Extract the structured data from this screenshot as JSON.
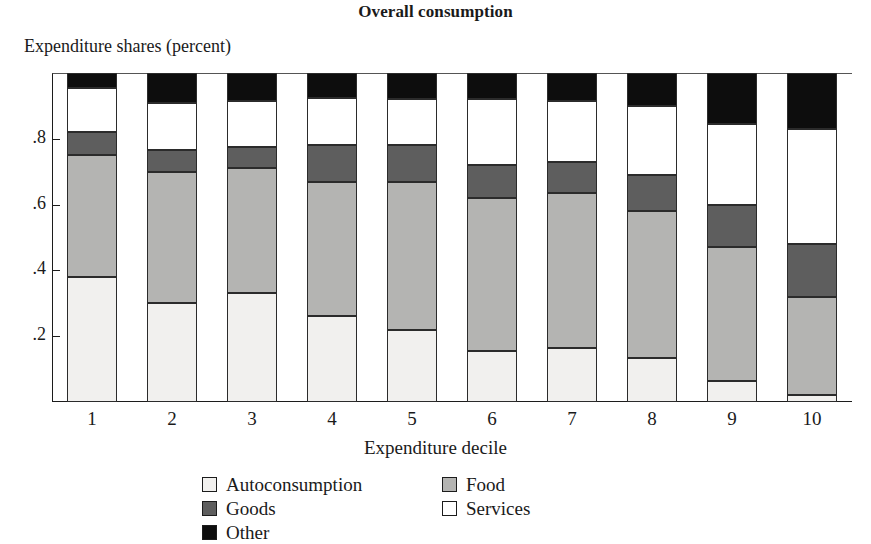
{
  "chart_data": {
    "type": "bar",
    "subtype": "stacked-bar",
    "title": "Overall consumption",
    "ylabel": "Expenditure shares (percent)",
    "xlabel": "Expenditure decile",
    "categories": [
      "1",
      "2",
      "3",
      "4",
      "5",
      "6",
      "7",
      "8",
      "9",
      "10"
    ],
    "ylim": [
      0,
      1
    ],
    "yticks": [
      0.2,
      0.4,
      0.6,
      0.8
    ],
    "ytick_labels": [
      ".2",
      ".4",
      ".6",
      ".8"
    ],
    "grid": false,
    "legend_position": "bottom",
    "stack_order": [
      "Autoconsumption",
      "Food",
      "Goods",
      "Services",
      "Other"
    ],
    "series": [
      {
        "name": "Autoconsumption",
        "color": "#f1f0ee",
        "values": [
          0.38,
          0.3,
          0.33,
          0.26,
          0.22,
          0.155,
          0.165,
          0.135,
          0.065,
          0.02
        ]
      },
      {
        "name": "Food",
        "color": "#b4b4b2",
        "values": [
          0.37,
          0.4,
          0.38,
          0.41,
          0.45,
          0.465,
          0.47,
          0.445,
          0.405,
          0.3
        ]
      },
      {
        "name": "Goods",
        "color": "#5e5e5e",
        "values": [
          0.07,
          0.065,
          0.065,
          0.11,
          0.11,
          0.1,
          0.095,
          0.11,
          0.13,
          0.16
        ]
      },
      {
        "name": "Services",
        "color": "#ffffff",
        "values": [
          0.135,
          0.145,
          0.14,
          0.145,
          0.14,
          0.2,
          0.185,
          0.21,
          0.245,
          0.35
        ]
      },
      {
        "name": "Other",
        "color": "#0d0d0d",
        "values": [
          0.045,
          0.09,
          0.085,
          0.075,
          0.08,
          0.08,
          0.085,
          0.1,
          0.155,
          0.17
        ]
      }
    ],
    "cumulative_tops": [
      [
        0.38,
        0.75,
        0.82,
        0.955,
        1.0
      ],
      [
        0.3,
        0.7,
        0.765,
        0.91,
        1.0
      ],
      [
        0.33,
        0.71,
        0.775,
        0.915,
        1.0
      ],
      [
        0.26,
        0.67,
        0.78,
        0.925,
        1.0
      ],
      [
        0.22,
        0.67,
        0.78,
        0.92,
        1.0
      ],
      [
        0.155,
        0.62,
        0.72,
        0.92,
        1.0
      ],
      [
        0.165,
        0.635,
        0.73,
        0.915,
        1.0
      ],
      [
        0.135,
        0.58,
        0.69,
        0.9,
        1.0
      ],
      [
        0.065,
        0.47,
        0.6,
        0.845,
        1.0
      ],
      [
        0.02,
        0.32,
        0.48,
        0.83,
        1.0
      ]
    ]
  },
  "legend": {
    "items": [
      {
        "label": "Autoconsumption",
        "color": "#f1f0ee"
      },
      {
        "label": "Food",
        "color": "#b4b4b2"
      },
      {
        "label": "Goods",
        "color": "#5e5e5e"
      },
      {
        "label": "Services",
        "color": "#ffffff"
      },
      {
        "label": "Other",
        "color": "#0d0d0d"
      }
    ]
  }
}
